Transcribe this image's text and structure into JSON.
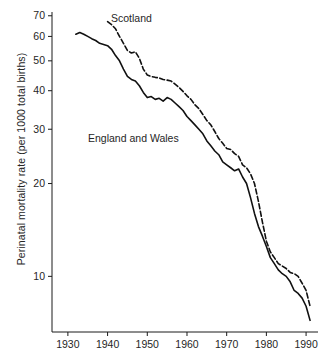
{
  "chart_data": {
    "type": "line",
    "title": "",
    "xlabel": "",
    "ylabel": "Perinatal mortality rate (per 1000 total births)",
    "yscale": "log",
    "xlim": [
      1926,
      1993
    ],
    "ylim": [
      6.6,
      72
    ],
    "grid": false,
    "legend_position": "inline-annotations",
    "xticks": [
      1930,
      1940,
      1950,
      1960,
      1970,
      1980,
      1990
    ],
    "xticklabels": [
      "1930",
      "1940",
      "1950",
      "1960",
      "1970",
      "1980",
      "1990"
    ],
    "yticks": [
      10,
      20,
      30,
      40,
      50,
      60,
      70
    ],
    "yticklabels": [
      "10",
      "20",
      "30",
      "40",
      "50",
      "60",
      "70"
    ],
    "series": [
      {
        "name": "England and Wales",
        "style": "solid",
        "color": "#111111",
        "x": [
          1932,
          1933,
          1934,
          1935,
          1936,
          1937,
          1938,
          1939,
          1940,
          1941,
          1942,
          1943,
          1944,
          1945,
          1946,
          1947,
          1948,
          1949,
          1950,
          1951,
          1952,
          1953,
          1954,
          1955,
          1956,
          1957,
          1958,
          1959,
          1960,
          1961,
          1962,
          1963,
          1964,
          1965,
          1966,
          1967,
          1968,
          1969,
          1970,
          1971,
          1972,
          1973,
          1974,
          1975,
          1976,
          1977,
          1978,
          1979,
          1980,
          1981,
          1982,
          1983,
          1984,
          1985,
          1986,
          1987,
          1988,
          1989,
          1990,
          1991
        ],
        "y": [
          61.0,
          61.8,
          61.0,
          60.0,
          59.0,
          58.2,
          57.0,
          56.5,
          56.0,
          54.5,
          52.0,
          50.0,
          47.0,
          44.5,
          43.5,
          43.0,
          41.5,
          39.5,
          38.0,
          38.3,
          37.5,
          37.8,
          37.0,
          38.0,
          37.5,
          36.5,
          35.5,
          34.5,
          33.0,
          32.0,
          31.0,
          30.0,
          29.0,
          27.5,
          26.5,
          25.5,
          24.8,
          23.5,
          23.0,
          22.5,
          22.0,
          22.3,
          21.0,
          20.0,
          18.0,
          16.0,
          14.5,
          13.5,
          12.5,
          11.5,
          11.0,
          10.5,
          10.2,
          10.0,
          9.6,
          9.0,
          8.8,
          8.5,
          8.0,
          7.2
        ]
      },
      {
        "name": "Scotland",
        "style": "dashed",
        "color": "#111111",
        "x": [
          1940,
          1941,
          1942,
          1943,
          1944,
          1945,
          1946,
          1947,
          1948,
          1949,
          1950,
          1951,
          1952,
          1953,
          1954,
          1955,
          1956,
          1957,
          1958,
          1959,
          1960,
          1961,
          1962,
          1963,
          1964,
          1965,
          1966,
          1967,
          1968,
          1969,
          1970,
          1971,
          1972,
          1973,
          1974,
          1975,
          1976,
          1977,
          1978,
          1979,
          1980,
          1981,
          1982,
          1983,
          1984,
          1985,
          1986,
          1987,
          1988,
          1989,
          1990,
          1991
        ],
        "y": [
          67.0,
          65.5,
          63.5,
          60.0,
          57.0,
          54.0,
          53.0,
          53.5,
          51.0,
          47.0,
          45.0,
          44.5,
          44.2,
          44.0,
          43.5,
          43.3,
          43.0,
          42.0,
          41.0,
          39.8,
          38.5,
          37.5,
          36.0,
          35.0,
          33.5,
          32.0,
          31.0,
          29.5,
          28.0,
          27.0,
          26.0,
          25.8,
          25.0,
          24.5,
          23.0,
          22.5,
          21.5,
          20.0,
          17.5,
          15.0,
          13.0,
          12.0,
          11.5,
          11.0,
          10.8,
          10.6,
          10.3,
          10.2,
          10.0,
          9.5,
          9.0,
          8.0
        ]
      }
    ],
    "annotations": [
      {
        "text": "Scotland",
        "for_series": "Scotland"
      },
      {
        "text": "England and Wales",
        "for_series": "England and Wales"
      }
    ]
  },
  "axis": {
    "y_title": "Perinatal mortality rate (per 1000 total births)"
  }
}
